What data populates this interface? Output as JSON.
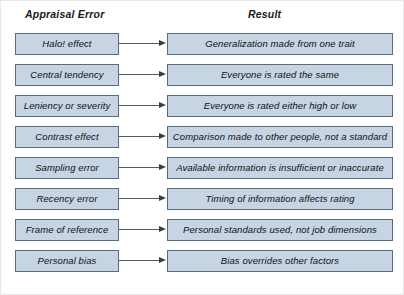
{
  "diagram": {
    "headers": {
      "left": "Appraisal Error",
      "right": "Result"
    },
    "colors": {
      "box_fill": "#c6d4e3",
      "box_border": "#5d6a7a",
      "arrow": "#3d3d3d",
      "text": "#111111",
      "background": "#ffffff"
    },
    "rows": [
      {
        "error": "Halo! effect",
        "result": "Generalization made from one trait"
      },
      {
        "error": "Central tendency",
        "result": "Everyone is rated the same"
      },
      {
        "error": "Leniency or severity",
        "result": "Everyone is rated either high or low"
      },
      {
        "error": "Contrast effect",
        "result": "Comparison made to other people, not a standard"
      },
      {
        "error": "Sampling error",
        "result": "Available information is insufficient or inaccurate"
      },
      {
        "error": "Recency error",
        "result": "Timing of information affects rating"
      },
      {
        "error": "Frame of reference",
        "result": "Personal standards used, not job dimensions"
      },
      {
        "error": "Personal bias",
        "result": "Bias overrides other factors"
      }
    ]
  }
}
